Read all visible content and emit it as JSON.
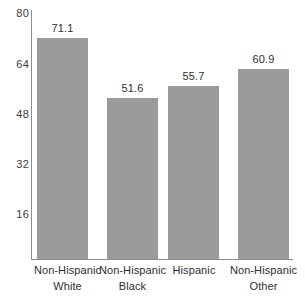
{
  "chart_data": {
    "type": "bar",
    "title": "",
    "subtitle": "",
    "xlabel": "",
    "ylabel": "",
    "categories": [
      "Non-Hispanic White",
      "Non-Hispanic Black",
      "Hispanic",
      "Non-Hispanic Other"
    ],
    "category_lines": [
      [
        "Non-Hispanic",
        "White"
      ],
      [
        "Non-Hispanic",
        "Black"
      ],
      [
        "Hispanic",
        ""
      ],
      [
        "Non-Hispanic",
        "Other"
      ]
    ],
    "values": [
      71.1,
      51.6,
      55.7,
      60.9
    ],
    "value_labels": [
      "71.1",
      "51.6",
      "55.7",
      "60.9"
    ],
    "ylim": [
      0,
      80
    ],
    "yticks": [
      80,
      64,
      48,
      32,
      16
    ],
    "ytick_labels": [
      "80",
      "64",
      "48",
      "32",
      "16"
    ],
    "grid": false,
    "legend": null,
    "bar_color": "#9b9b9b",
    "axis_color": "#8d8d8d",
    "text_color": "#2f2f2f",
    "background": "#ffffff"
  }
}
